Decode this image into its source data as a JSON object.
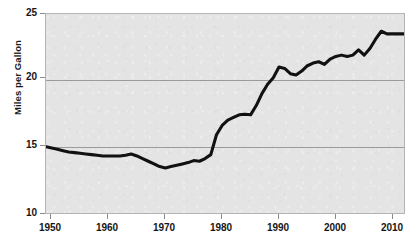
{
  "chart_data": {
    "type": "line",
    "title": "",
    "subtitle": "",
    "xlabel": "",
    "ylabel": "Miles per Gallon",
    "xlim": [
      1950,
      2013
    ],
    "ylim": [
      10,
      25
    ],
    "grid": true,
    "gridlines_y": [
      15,
      20
    ],
    "legend": null,
    "legend_position": "none",
    "y_ticks": [
      10,
      15,
      20,
      25
    ],
    "y_tick_labels": [
      "10",
      "15",
      "20",
      "25"
    ],
    "x_ticks": [
      1950,
      1960,
      1970,
      1980,
      1990,
      2000,
      2010
    ],
    "x_tick_labels": [
      "1950",
      "1960",
      "1970",
      "1980",
      "1990",
      "2000",
      "2010"
    ],
    "series": [
      {
        "name": "Miles per Gallon",
        "color": "#111111",
        "x": [
          1950,
          1951,
          1952,
          1953,
          1954,
          1955,
          1956,
          1957,
          1958,
          1959,
          1960,
          1961,
          1962,
          1963,
          1964,
          1965,
          1966,
          1967,
          1968,
          1969,
          1970,
          1971,
          1972,
          1973,
          1974,
          1975,
          1976,
          1977,
          1978,
          1979,
          1980,
          1981,
          1982,
          1983,
          1984,
          1985,
          1986,
          1987,
          1988,
          1989,
          1990,
          1991,
          1992,
          1993,
          1994,
          1995,
          1996,
          1997,
          1998,
          1999,
          2000,
          2001,
          2002,
          2003,
          2004,
          2005,
          2006,
          2007,
          2008,
          2009,
          2010,
          2011,
          2012,
          2013
        ],
        "values": [
          15.0,
          14.9,
          14.8,
          14.7,
          14.6,
          14.55,
          14.5,
          14.45,
          14.4,
          14.35,
          14.3,
          14.3,
          14.3,
          14.3,
          14.35,
          14.45,
          14.3,
          14.1,
          13.9,
          13.7,
          13.5,
          13.4,
          13.5,
          13.6,
          13.7,
          13.8,
          13.95,
          13.9,
          14.1,
          14.4,
          15.9,
          16.6,
          17.0,
          17.2,
          17.4,
          17.45,
          17.4,
          18.1,
          19.0,
          19.7,
          20.2,
          21.0,
          20.9,
          20.5,
          20.4,
          20.7,
          21.1,
          21.3,
          21.4,
          21.2,
          21.6,
          21.8,
          21.9,
          21.8,
          21.9,
          22.3,
          21.9,
          22.4,
          23.1,
          23.7,
          23.5,
          23.5,
          23.5,
          23.5
        ]
      }
    ],
    "annotations": []
  },
  "axes": {
    "y_title": "Miles per Gallon",
    "y_labels": [
      "25",
      "20",
      "15",
      "10"
    ],
    "x_labels": [
      "1950",
      "1960",
      "1970",
      "1980",
      "1990",
      "2000",
      "2010"
    ]
  },
  "colors": {
    "plot_background": "#e4e4e4",
    "plot_border": "#b4b4b4",
    "gridline": "#9a9a9a",
    "line": "#111111",
    "text": "#161616",
    "page_background": "#ffffff"
  }
}
